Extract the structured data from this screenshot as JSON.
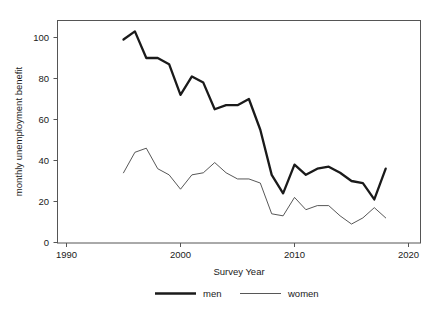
{
  "chart_data": {
    "type": "line",
    "title": "",
    "xlabel": "Survey Year",
    "ylabel": "monthly unemployment benefit",
    "xlim": [
      1986,
      2023
    ],
    "ylim": [
      -3,
      108
    ],
    "grid": false,
    "legend_position": "bottom",
    "x_ticks": [
      1990,
      2000,
      2010,
      2020
    ],
    "y_ticks": [
      0,
      20,
      40,
      60,
      80,
      100
    ],
    "x": [
      1995,
      1996,
      1997,
      1998,
      1999,
      2000,
      2001,
      2002,
      2003,
      2004,
      2005,
      2006,
      2007,
      2008,
      2009,
      2010,
      2011,
      2012,
      2013,
      2014,
      2015,
      2016,
      2017,
      2018
    ],
    "series": [
      {
        "name": "men",
        "style": "thick",
        "values": [
          99,
          103,
          90,
          90,
          87,
          72,
          81,
          78,
          65,
          67,
          67,
          70,
          55,
          33,
          24,
          38,
          33,
          36,
          37,
          34,
          30,
          29,
          21,
          36
        ]
      },
      {
        "name": "women",
        "style": "thin",
        "values": [
          34,
          44,
          46,
          36,
          33,
          26,
          33,
          34,
          39,
          34,
          31,
          31,
          29,
          14,
          13,
          22,
          16,
          18,
          18,
          13,
          9,
          12,
          17,
          12
        ]
      }
    ]
  },
  "axes": {
    "x_label": "Survey Year",
    "y_label": "monthly unemployment benefit",
    "x_tick_labels": [
      "1990",
      "2000",
      "2010",
      "2020"
    ],
    "y_tick_labels": [
      "0",
      "20",
      "40",
      "60",
      "80",
      "100"
    ]
  },
  "legend": {
    "entries": [
      {
        "label": "men"
      },
      {
        "label": "women"
      }
    ]
  },
  "colors": {
    "men_line": "#1a1a1a",
    "women_line": "#444444",
    "frame": "#555555",
    "text": "#1a1a1a",
    "background": "#ffffff"
  }
}
